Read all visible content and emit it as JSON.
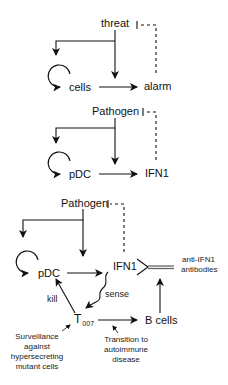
{
  "panels": [
    {
      "id": "generic",
      "trigger": "threat",
      "source": "cells",
      "target": "alarm"
    },
    {
      "id": "pdc",
      "trigger": "Pathogen",
      "source": "pDC",
      "target": "IFN1"
    },
    {
      "id": "t007",
      "trigger": "Pathogen",
      "source": "pDC",
      "target": "IFN1",
      "antibody_label_line1": "anti-IFN1",
      "antibody_label_line2": "antibodies",
      "sensor": "T",
      "sensor_subscript": "007",
      "downstream": "B cells",
      "edge_kill": "kill",
      "edge_sense": "sense",
      "note_surveillance": [
        "Surveillance",
        "against",
        "hypersecreting",
        "mutant cells"
      ],
      "note_transition": [
        "Transition to",
        "autoimmune",
        "disease"
      ]
    }
  ],
  "colors": {
    "line": "#111111",
    "antibody": "#777777"
  }
}
